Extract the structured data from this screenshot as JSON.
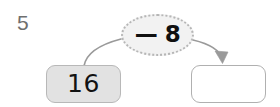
{
  "problem": {
    "number": "5",
    "type": "function-machine",
    "input_value": "16",
    "operation": "— 8",
    "operation_symbol": "minus",
    "operand": "8",
    "answer_value": "",
    "answer_is_blank": true
  },
  "boxes": {
    "input": {
      "label": "16",
      "fill_color": "#e2e2e2",
      "border_color": "#b8b8b8"
    },
    "answer": {
      "label": "",
      "placeholder": "",
      "fill_color": "#ffffff",
      "border_color": "#b0b0b0"
    }
  },
  "bubble": {
    "label": "— 8",
    "fill_color": "#f2f2f2",
    "border_color": "#b6b6b6",
    "border_style": "dotted"
  },
  "arrows": {
    "left": {
      "name": "input-to-operation-arc",
      "has_arrowhead": false,
      "color": "#9a9a9a"
    },
    "right": {
      "name": "operation-to-answer-arrow",
      "has_arrowhead": true,
      "color": "#9a9a9a"
    }
  },
  "colors": {
    "problem_number": "#6f6f6f",
    "text": "#121212",
    "stroke": "#9a9a9a",
    "background": "#ffffff"
  }
}
